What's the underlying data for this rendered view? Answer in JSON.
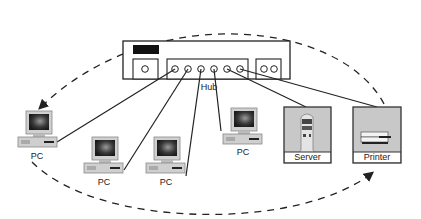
{
  "diagram": {
    "type": "network-topology",
    "hub": {
      "label": "Hub",
      "ports": 6
    },
    "devices": [
      {
        "id": "pc1",
        "type": "PC",
        "label": "PC"
      },
      {
        "id": "pc2",
        "type": "PC",
        "label": "PC"
      },
      {
        "id": "pc3",
        "type": "PC",
        "label": "PC"
      },
      {
        "id": "pc4",
        "type": "PC",
        "label": "PC"
      },
      {
        "id": "server",
        "type": "Server",
        "label": "Server"
      },
      {
        "id": "printer",
        "type": "Printer",
        "label": "Printer"
      }
    ],
    "connections": [
      {
        "from": "hub",
        "to": "pc1",
        "style": "solid"
      },
      {
        "from": "hub",
        "to": "pc2",
        "style": "solid"
      },
      {
        "from": "hub",
        "to": "pc3",
        "style": "solid"
      },
      {
        "from": "hub",
        "to": "pc4",
        "style": "solid"
      },
      {
        "from": "hub",
        "to": "server",
        "style": "solid"
      },
      {
        "from": "hub",
        "to": "printer",
        "style": "solid"
      }
    ],
    "flows": [
      {
        "from": "printer",
        "to": "pc1",
        "style": "dashed-arrow",
        "path": "top-arc"
      },
      {
        "from": "pc1",
        "to": "printer",
        "style": "dashed-arrow",
        "path": "bottom-arc"
      }
    ],
    "colors": {
      "line": "#222222",
      "device_fill": "#c8c8c8",
      "screen": "#2a2a2a"
    }
  }
}
